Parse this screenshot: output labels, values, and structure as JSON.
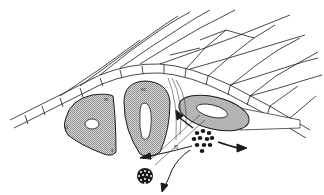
{
  "figure": {
    "type": "anatomical-diagram",
    "colors": {
      "line": "#1a1a1a",
      "stipple_fill": "#b8b8b8",
      "tube_fill": "#c4c4c4",
      "background": "#ffffff",
      "cell_dots": "#1a1a1a"
    }
  },
  "labels": {
    "somite_top": "m",
    "somite_left": "d",
    "somite_bottom": "s",
    "sclerotome": "sc",
    "arrow_label": "n"
  },
  "structures": [
    {
      "id": "ectoderm-sheet",
      "label": ""
    },
    {
      "id": "dermomyotome",
      "label": "m / d / s"
    },
    {
      "id": "sclerotome-block",
      "label": "sc"
    },
    {
      "id": "neural-tube",
      "label": ""
    },
    {
      "id": "cell-cluster",
      "label": ""
    },
    {
      "id": "nerve-bundle",
      "label": ""
    }
  ]
}
